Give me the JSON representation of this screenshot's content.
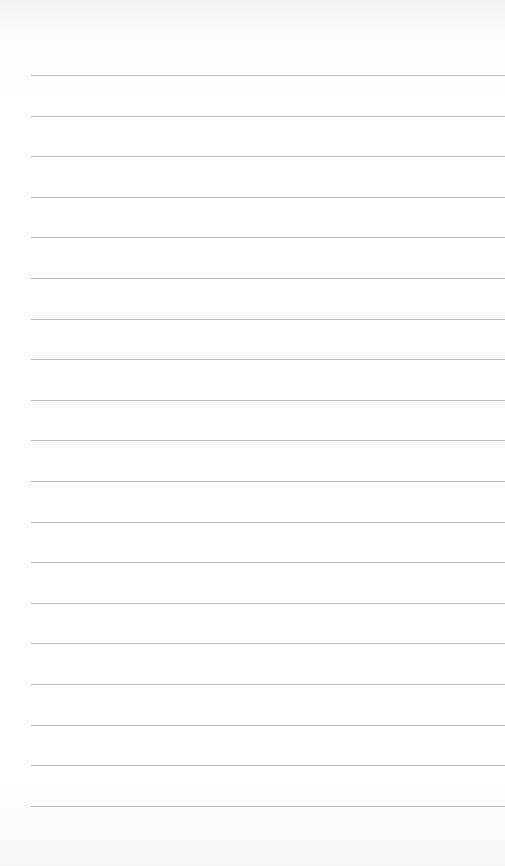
{
  "paper": {
    "background": "#ffffff",
    "line_color": "#bdbdbd",
    "line_count": 19,
    "line_start_x": 31,
    "first_line_y": 75,
    "line_spacing": 40.6
  }
}
